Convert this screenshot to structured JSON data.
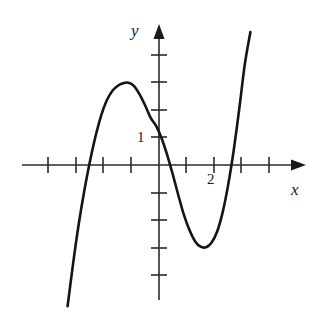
{
  "figure": {
    "title": "",
    "background_color": "#ffffff",
    "ink_color": "#1a1a1a",
    "curve_color": "#141414"
  },
  "axes": {
    "x_axis_label": "x",
    "y_axis_label": "y",
    "origin_px": {
      "x": 159,
      "y": 165
    },
    "unit_px": 27.7,
    "x_tick_values": [
      -4,
      -3,
      -2,
      -1,
      1,
      2,
      3,
      4
    ],
    "y_tick_values": [
      4,
      3,
      2,
      1,
      -1,
      -2,
      -3,
      -4
    ],
    "x_tick_labels": [
      {
        "value": 2,
        "text": "2"
      }
    ],
    "y_tick_labels": [
      {
        "value": 1,
        "text": "1"
      }
    ],
    "x_range": [
      -4.8,
      5.3
    ],
    "y_range": [
      -5.2,
      4.9
    ],
    "arrowheads": [
      "x-positive",
      "y-positive"
    ],
    "grid": "off"
  },
  "chart_data": {
    "type": "line",
    "title": "",
    "xlabel": "x",
    "ylabel": "y",
    "xlim": [
      -4.8,
      5.3
    ],
    "ylim": [
      -5.2,
      4.9
    ],
    "grid": false,
    "legend": "none",
    "series": [
      {
        "name": "cubic curve",
        "x": [
          -3.3,
          -3.1,
          -2.9,
          -2.7,
          -2.5,
          -2.3,
          -2.1,
          -1.9,
          -1.7,
          -1.5,
          -1.3,
          -1.1,
          -0.9,
          -0.7,
          -0.5,
          -0.3,
          -0.1,
          0.1,
          0.3,
          0.5,
          0.7,
          0.9,
          1.1,
          1.3,
          1.5,
          1.7,
          1.9,
          2.1,
          2.3,
          2.5,
          2.7,
          2.9,
          3.1,
          3.3
        ],
        "y": [
          -5.1,
          -3.55,
          -2.15,
          -0.95,
          0.1,
          1.0,
          1.75,
          2.3,
          2.65,
          2.85,
          2.95,
          2.97,
          2.85,
          2.55,
          2.15,
          1.7,
          1.4,
          0.95,
          0.35,
          -0.35,
          -1.1,
          -1.8,
          -2.35,
          -2.75,
          -2.95,
          -2.97,
          -2.8,
          -2.4,
          -1.7,
          -0.7,
          0.55,
          2.05,
          3.65,
          4.8
        ],
        "annotations": {
          "local_maximum": {
            "x": -1.1,
            "y": 2.95
          },
          "local_minimum": {
            "x": 1.75,
            "y": -2.97
          },
          "y_intercept": {
            "x": 0,
            "y": 1.3
          },
          "x_intercepts": [
            -2.55,
            0.22,
            2.55
          ]
        }
      }
    ]
  }
}
